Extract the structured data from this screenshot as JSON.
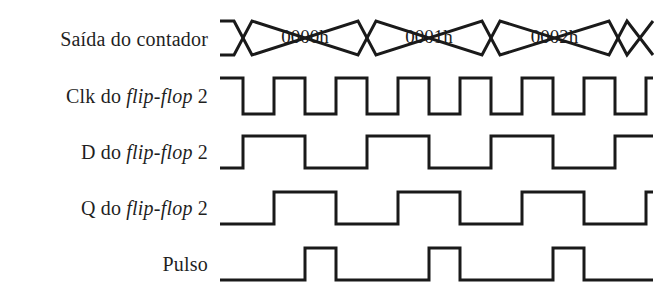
{
  "figure": {
    "type": "digital-timing-diagram",
    "language": "pt-BR",
    "background_color": "#ffffff",
    "line_color": "#1a1a1a"
  },
  "labels": {
    "counter_output": "Saída do contador",
    "clk_ff2_prefix": "Clk do ",
    "clk_ff2_italic": "flip-flop",
    "clk_ff2_suffix": " 2",
    "d_ff2_prefix": "D do ",
    "d_ff2_italic": "flip-flop",
    "d_ff2_suffix": " 2",
    "q_ff2_prefix": "Q do ",
    "q_ff2_italic": "flip-flop",
    "q_ff2_suffix": " 2",
    "pulse": "Pulso"
  },
  "bus_values": [
    "0000h",
    "0001h",
    "0002h"
  ],
  "chart_data": {
    "type": "line",
    "xlabel": "",
    "ylabel": "",
    "x_start_px": 220,
    "x_end_px": 653,
    "clock_period_px": 62,
    "clock_half_period_px": 31,
    "signals": [
      {
        "name": "Saída do contador",
        "kind": "bus",
        "top_y": 21,
        "bottom_y": 55,
        "transitions_px": [
          243,
          367,
          491,
          618
        ],
        "segment_labels": [
          "0000h",
          "0001h",
          "0002h"
        ]
      },
      {
        "name": "Clk do flip-flop 2",
        "kind": "clock",
        "high_y": 78,
        "low_y": 114,
        "initial_level": "high",
        "edges_px": [
          243,
          274,
          305,
          336,
          367,
          398,
          429,
          460,
          491,
          522,
          553,
          584,
          615,
          646
        ]
      },
      {
        "name": "D do flip-flop 2",
        "kind": "logic",
        "high_y": 136,
        "low_y": 168,
        "initial_level": "low",
        "edges_px": [
          243,
          305,
          367,
          429,
          491,
          553,
          615
        ]
      },
      {
        "name": "Q do flip-flop 2",
        "kind": "logic",
        "high_y": 192,
        "low_y": 224,
        "initial_level": "low",
        "edges_px": [
          274,
          336,
          398,
          460,
          522,
          584,
          646
        ]
      },
      {
        "name": "Pulso",
        "kind": "logic",
        "high_y": 248,
        "low_y": 280,
        "initial_level": "low",
        "edges_px": [
          305,
          336,
          429,
          460,
          553,
          584
        ]
      }
    ]
  }
}
